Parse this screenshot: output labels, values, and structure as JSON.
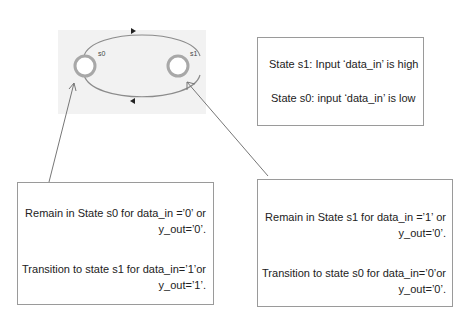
{
  "diagram": {
    "states": [
      {
        "id": "s0",
        "label": "s0"
      },
      {
        "id": "s1",
        "label": "s1"
      }
    ],
    "colors": {
      "state_fill": "#ffffff",
      "state_ring": "#a8a8a8",
      "edge": "#8c8c8c",
      "background": "#f2f2f2",
      "box_border": "#9a9a9a"
    }
  },
  "legend_box": {
    "line1": "State s1: Input ‘data_in’ is high",
    "line2": "State s0: input ‘data_in’ is low"
  },
  "s0_box": {
    "remain_line1": "Remain in State s0 for data_in =’0’ or",
    "remain_line2": "y_out=’0’.",
    "transition_line1": "Transition to state s1 for data_in=’1’or",
    "transition_line2": "y_out=’1’."
  },
  "s1_box": {
    "remain_line1": "Remain in State s1 for data_in =’1’ or",
    "remain_line2": "y_out=’0’.",
    "transition_line1": "Transition to state s0 for data_in=’0’or",
    "transition_line2": "y_out=’0’."
  }
}
